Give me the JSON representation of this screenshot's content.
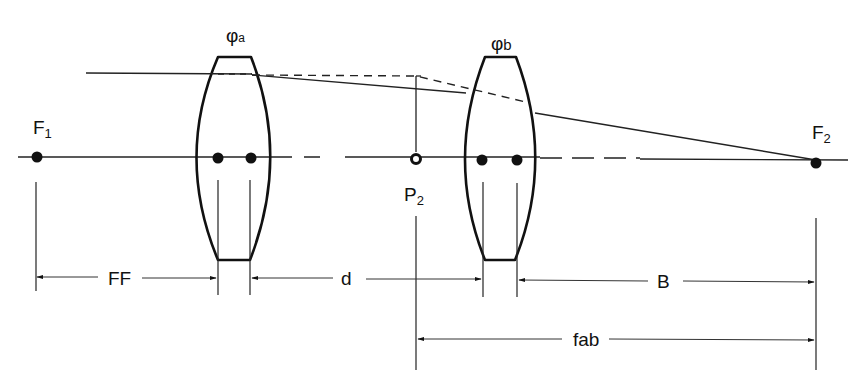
{
  "diagram": {
    "type": "two-lens optical system schematic",
    "colors": {
      "ink": "#111111",
      "background": "#ffffff"
    },
    "lenses": [
      {
        "id": "a",
        "symbol": "φ",
        "subscript": "a"
      },
      {
        "id": "b",
        "symbol": "φ",
        "subscript": "b"
      }
    ],
    "points": {
      "F1": {
        "main": "F",
        "sub": "1"
      },
      "F2": {
        "main": "F",
        "sub": "2"
      },
      "P2": {
        "main": "P",
        "sub": "2"
      }
    },
    "dimensions": {
      "FF": "FF",
      "d": "d",
      "B": "B",
      "fab": "fab"
    }
  }
}
